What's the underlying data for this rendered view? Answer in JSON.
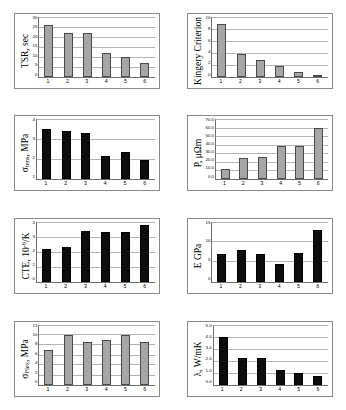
{
  "figure": {
    "layout": "2 columns x 4 rows of bar charts",
    "categories": [
      "1",
      "2",
      "3",
      "4",
      "5",
      "6"
    ],
    "colors": {
      "gray_bar": "#a6a6a6",
      "black_bar": "#0d0d0d",
      "gridline": "#b4b4b4",
      "axis": "#6f6f6f",
      "panel_border": "#8a8a8a",
      "background": "#ffffff"
    }
  },
  "chart_data": [
    {
      "type": "bar",
      "id": "tsr",
      "title": "",
      "ylabel": "TSR, sec",
      "ylabel_plain": "TSR, sec",
      "xlabel": "",
      "categories": [
        "1",
        "2",
        "3",
        "4",
        "5",
        "6"
      ],
      "values": [
        26,
        22,
        22,
        12,
        10,
        7
      ],
      "ylim": [
        0,
        30
      ],
      "yticks": [
        "30",
        "25",
        "20",
        "15",
        "10",
        "5",
        "0"
      ],
      "bar_color": "#a6a6a6",
      "grid": true,
      "legend": "none"
    },
    {
      "type": "bar",
      "id": "kingery-criterion",
      "title": "",
      "ylabel": "Kingery Criterion",
      "ylabel_plain": "Kingery Criterion",
      "xlabel": "",
      "categories": [
        "1",
        "2",
        "3",
        "4",
        "5",
        "6"
      ],
      "values": [
        8.8,
        3.8,
        2.9,
        1.8,
        0.9,
        0.15
      ],
      "ylim": [
        0,
        10
      ],
      "yticks": [
        "10",
        "8",
        "6",
        "4",
        "2",
        "0"
      ],
      "bar_color": "#a6a6a6",
      "grid": true,
      "legend": "none"
    },
    {
      "type": "bar",
      "id": "sigma-tens",
      "title": "",
      "ylabel_parts": {
        "pre": "σ",
        "sub": "tens",
        "post": ", MPa"
      },
      "ylabel_plain": "σtens, MPa",
      "xlabel": "",
      "categories": [
        "1",
        "2",
        "3",
        "4",
        "5",
        "6"
      ],
      "values": [
        3.5,
        3.4,
        3.3,
        2.15,
        2.35,
        1.95
      ],
      "ylim": [
        1,
        4
      ],
      "yticks": [
        "4",
        "3",
        "2",
        "1"
      ],
      "bar_color": "#0d0d0d",
      "grid": true,
      "legend": "none"
    },
    {
      "type": "bar",
      "id": "resistivity",
      "title": "",
      "ylabel": "P, μΩm",
      "ylabel_plain": "P, μΩm",
      "xlabel": "",
      "categories": [
        "1",
        "2",
        "3",
        "4",
        "5",
        "6"
      ],
      "values": [
        12,
        24,
        26,
        38,
        39,
        59
      ],
      "ylim": [
        0,
        70
      ],
      "yticks": [
        "70.0",
        "60.0",
        "50.0",
        "40.0",
        "30.0",
        "20.0",
        "10.0",
        "0.0"
      ],
      "bar_color": "#a6a6a6",
      "grid": true,
      "legend": "none"
    },
    {
      "type": "bar",
      "id": "cte",
      "title": "",
      "ylabel_parts": {
        "pre": "CTE, 10",
        "sup": "-6",
        "post": "/K"
      },
      "ylabel_plain": "CTE, 10-6/K",
      "xlabel": "",
      "categories": [
        "1",
        "2",
        "3",
        "4",
        "5",
        "6"
      ],
      "values": [
        2.2,
        2.3,
        3.4,
        3.3,
        3.3,
        3.8
      ],
      "ylim": [
        0,
        4
      ],
      "yticks": [
        "4",
        "3",
        "2",
        "1",
        "0"
      ],
      "bar_color": "#0d0d0d",
      "grid": true,
      "legend": "none"
    },
    {
      "type": "bar",
      "id": "youngs-modulus",
      "title": "",
      "ylabel": "E GPa",
      "ylabel_plain": "E GPa",
      "xlabel": "",
      "categories": [
        "1",
        "2",
        "3",
        "4",
        "5",
        "6"
      ],
      "values": [
        7,
        8,
        7,
        4.5,
        7.2,
        13
      ],
      "ylim": [
        0,
        15
      ],
      "yticks": [
        "15",
        "10",
        "5",
        "0"
      ],
      "bar_color": "#0d0d0d",
      "grid": true,
      "legend": "none"
    },
    {
      "type": "bar",
      "id": "sigma-flex",
      "title": "",
      "ylabel_parts": {
        "pre": "σ",
        "sub": "Flex",
        "post": ", MPa"
      },
      "ylabel_plain": "σFlex, MPa",
      "xlabel": "",
      "categories": [
        "1",
        "2",
        "3",
        "4",
        "5",
        "6"
      ],
      "values": [
        6.9,
        10.0,
        8.6,
        8.9,
        9.9,
        8.5
      ],
      "ylim": [
        0,
        12
      ],
      "yticks": [
        "12",
        "10",
        "8",
        "6",
        "4",
        "2",
        "0"
      ],
      "bar_color": "#a6a6a6",
      "grid": true,
      "legend": "none"
    },
    {
      "type": "bar",
      "id": "thermal-conductivity",
      "title": "",
      "ylabel": "λ, W/mK",
      "ylabel_plain": "λ, W/mK",
      "xlabel": "",
      "categories": [
        "1",
        "2",
        "3",
        "4",
        "5",
        "6"
      ],
      "values": [
        4.0,
        2.2,
        2.2,
        1.2,
        1.0,
        0.7
      ],
      "ylim": [
        0,
        5
      ],
      "yticks": [
        "5.0",
        "4.0",
        "3.0",
        "2.0",
        "1.0",
        "0.0"
      ],
      "bar_color": "#0d0d0d",
      "grid": true,
      "legend": "none"
    }
  ]
}
